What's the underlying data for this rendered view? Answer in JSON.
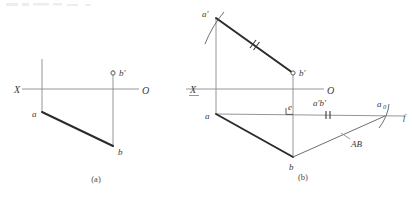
{
  "document": {
    "kind": "descriptive-geometry-figure",
    "title": "",
    "background_color": "#ffffff",
    "ink_color": "#2b2b2b",
    "light_ink_color": "#8a8a8a"
  },
  "figures": [
    {
      "id": "a",
      "caption": "(a)",
      "caption_pos": {
        "x": 96,
        "y": 182
      },
      "axis": {
        "label_left": "X",
        "label_left_pos": {
          "x": 14,
          "y": 93
        },
        "label_left_underlined": false,
        "label_right": "O",
        "label_right_pos": {
          "x": 142,
          "y": 94
        },
        "line": {
          "x1": 22,
          "y1": 89,
          "x2": 139,
          "y2": 89
        }
      },
      "projection_lines": [
        {
          "name": "a-vertical",
          "x1": 42,
          "y1": 59,
          "x2": 42,
          "y2": 112
        },
        {
          "name": "b-vertical",
          "x1": 113,
          "y1": 70,
          "x2": 113,
          "y2": 146
        }
      ],
      "points": [
        {
          "name": "a",
          "label": "a",
          "x": 42,
          "y": 112,
          "style": "corner",
          "label_pos": {
            "x": 32,
            "y": 117
          }
        },
        {
          "name": "b",
          "label": "b",
          "x": 113,
          "y": 146,
          "style": "corner",
          "label_pos": {
            "x": 118,
            "y": 155
          }
        },
        {
          "name": "b'",
          "label": "b′",
          "x": 113,
          "y": 73,
          "style": "open-circle",
          "label_pos": {
            "x": 119,
            "y": 73
          }
        }
      ],
      "segments": [
        {
          "name": "ab-horizontal-projection",
          "x1": 42,
          "y1": 112,
          "x2": 113,
          "y2": 146,
          "weight": "thick"
        }
      ]
    },
    {
      "id": "b",
      "caption": "(b)",
      "caption_pos": {
        "x": 297,
        "y": 180
      },
      "axis": {
        "label_left": "X",
        "label_left_pos": {
          "x": 190,
          "y": 93
        },
        "label_left_underlined": true,
        "label_right": "O",
        "label_right_pos": {
          "x": 327,
          "y": 94
        },
        "line": {
          "x1": 186,
          "y1": 89,
          "x2": 324,
          "y2": 89
        }
      },
      "projection_lines": [
        {
          "name": "a-vertical",
          "x1": 216,
          "y1": 18,
          "x2": 216,
          "y2": 114
        },
        {
          "name": "b-vertical",
          "x1": 293,
          "y1": 73,
          "x2": 293,
          "y2": 157
        },
        {
          "name": "base-horizontal-a-to-f",
          "x1": 216,
          "y1": 114,
          "x2": 404,
          "y2": 116
        }
      ],
      "points": [
        {
          "name": "a'",
          "label": "a′",
          "x": 216,
          "y": 18,
          "style": "corner",
          "label_pos": {
            "x": 203,
            "y": 17
          }
        },
        {
          "name": "b'",
          "label": "b′",
          "x": 293,
          "y": 73,
          "style": "open-circle",
          "label_pos": {
            "x": 299,
            "y": 73
          }
        },
        {
          "name": "a",
          "label": "a",
          "x": 216,
          "y": 114,
          "style": "corner",
          "label_pos": {
            "x": 206,
            "y": 119
          }
        },
        {
          "name": "b",
          "label": "b",
          "x": 293,
          "y": 157,
          "style": "corner",
          "label_pos": {
            "x": 290,
            "y": 168
          }
        },
        {
          "name": "e",
          "label": "e",
          "x": 293,
          "y": 114,
          "style": "plain",
          "label_pos": {
            "x": 289,
            "y": 111
          }
        },
        {
          "name": "a0",
          "label": "a",
          "subscript": "0",
          "x": 385,
          "y": 116,
          "style": "plain",
          "label_pos": {
            "x": 378,
            "y": 108
          }
        },
        {
          "name": "f",
          "label": "f",
          "x": 404,
          "y": 117,
          "style": "plain",
          "label_pos": {
            "x": 404,
            "y": 119
          }
        }
      ],
      "segments": [
        {
          "name": "a'b'-frontal-projection",
          "x1": 216,
          "y1": 18,
          "x2": 293,
          "y2": 73,
          "weight": "thick"
        },
        {
          "name": "ab-horizontal-projection",
          "x1": 216,
          "y1": 114,
          "x2": 293,
          "y2": 157,
          "weight": "thick"
        },
        {
          "name": "b-a0-true-length",
          "x1": 293,
          "y1": 157,
          "x2": 385,
          "y2": 116,
          "weight": "thin-dark"
        }
      ],
      "annotations": [
        {
          "name": "true-length-label",
          "label": "AB",
          "x": 352,
          "y": 144,
          "leader": {
            "x1": 341,
            "y1": 134,
            "x2": 351,
            "y2": 138
          }
        },
        {
          "name": "a'b'-measure-label",
          "label": "a′b′",
          "x": 322,
          "y": 106
        }
      ],
      "tick_marks": [
        {
          "name": "tick-on-a'b'",
          "count": 2,
          "at_x": 253,
          "at_y": 45
        },
        {
          "name": "tick-on-base",
          "count": 2,
          "at_x": 328,
          "at_y": 115
        }
      ],
      "arcs": [
        {
          "name": "arc-through-a-prime",
          "cx": 216,
          "cy": 114,
          "label": "swing-arc"
        },
        {
          "name": "arc-through-a0",
          "cx": 293,
          "cy": 157,
          "label": "swing-arc"
        }
      ],
      "right_angle_marker": {
        "name": "right-angle-at-e",
        "x": 293,
        "y": 114
      }
    }
  ]
}
